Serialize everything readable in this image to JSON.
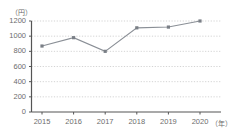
{
  "chart_data": {
    "type": "line",
    "title": "",
    "subtitle": "",
    "xlabel": "（年）",
    "ylabel": "（円）",
    "categories": [
      "2015",
      "2016",
      "2017",
      "2018",
      "2019",
      "2020"
    ],
    "values": [
      870,
      980,
      800,
      1110,
      1120,
      1200
    ],
    "series": [
      {
        "name": "",
        "values": [
          870,
          980,
          800,
          1110,
          1120,
          1200
        ]
      }
    ],
    "ylim": [
      0,
      1200
    ],
    "ytick_labels": [
      "0",
      "200",
      "400",
      "600",
      "800",
      "1000",
      "1200"
    ],
    "ytick_values": [
      0,
      200,
      400,
      600,
      800,
      1000,
      1200
    ],
    "xtick_labels": [
      "2015",
      "2016",
      "2017",
      "2018",
      "2019",
      "2020"
    ],
    "grid": "horizontal-dotted",
    "legend": "none",
    "marker": "square",
    "colors": {
      "line": "#8a8f96",
      "marker": "#7a7f86",
      "grid": "#c8c8c8",
      "axis": "#555555",
      "text": "#6d6d6d",
      "background": "#ffffff"
    }
  },
  "axis": {
    "y_unit": "（円）",
    "x_unit": "（年）"
  }
}
